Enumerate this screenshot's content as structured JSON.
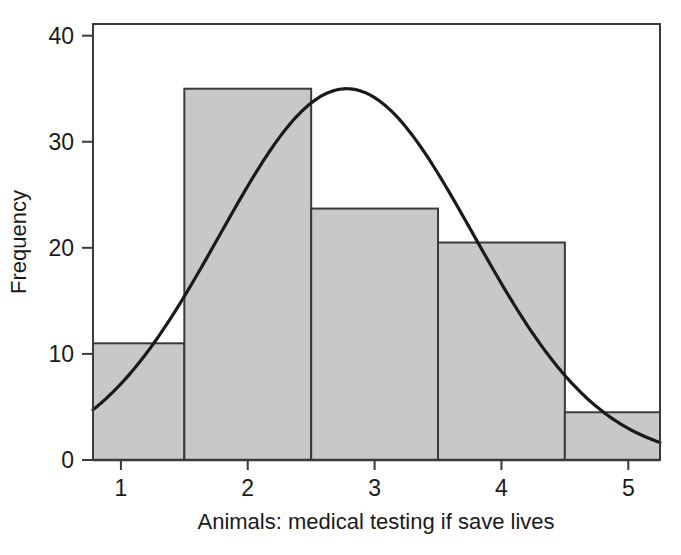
{
  "chart_data": {
    "type": "bar",
    "title": "",
    "subtitle": "",
    "xlabel": "Animals: medical testing if save lives",
    "ylabel": "Frequency",
    "xlim": [
      0.78,
      5.25
    ],
    "ylim": [
      0,
      41.1
    ],
    "grid": false,
    "legend": null,
    "x_ticks": [
      1,
      2,
      3,
      4,
      5
    ],
    "x_tick_labels": [
      "1",
      "2",
      "3",
      "4",
      "5"
    ],
    "y_ticks": [
      0,
      10,
      20,
      30,
      40
    ],
    "y_tick_labels": [
      "0",
      "10",
      "20",
      "30",
      "40"
    ],
    "bar_color": "#c8c8c8",
    "bar_edge_color": "#3a3a3a",
    "curve_color": "#1a1a1a",
    "axis_color": "#3a3a3a",
    "bin_edges": [
      0.5,
      1.5,
      2.5,
      3.5,
      4.5,
      5.5
    ],
    "bin_centers": [
      1,
      2,
      3,
      4,
      5
    ],
    "categories": [
      "1",
      "2",
      "3",
      "4",
      "5"
    ],
    "values": [
      11,
      35,
      23.7,
      20.5,
      4.5
    ],
    "overlay": {
      "type": "line",
      "name": "normal-curve",
      "mean": 2.78,
      "std": 1.0,
      "peak_value": 35,
      "x_start": 0.78,
      "x_end": 5.25,
      "y_start": 7.4,
      "y_end": 2.0
    }
  },
  "axes": {
    "y_axis_title": "Frequency",
    "x_axis_title": "Animals: medical testing if save lives"
  }
}
